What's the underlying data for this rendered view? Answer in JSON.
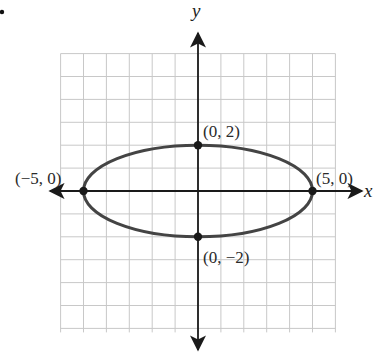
{
  "chart_data": {
    "type": "line",
    "title": "",
    "subtitle": "",
    "xlabel": "x",
    "ylabel": "y",
    "xlim": [
      -6,
      6
    ],
    "ylim": [
      -6,
      6
    ],
    "grid": true,
    "legend": null,
    "curve": {
      "kind": "ellipse",
      "equation": "x^2/25 + y^2/4 = 1",
      "center": [
        0,
        0
      ],
      "semi_major_x": 5,
      "semi_minor_y": 2
    },
    "points": [
      {
        "x": -5,
        "y": 0,
        "label": "(−5, 0)"
      },
      {
        "x": 5,
        "y": 0,
        "label": "(5, 0)"
      },
      {
        "x": 0,
        "y": 2,
        "label": "(0, 2)"
      },
      {
        "x": 0,
        "y": -2,
        "label": "(0, −2)"
      }
    ],
    "annotations": [
      "(−5, 0)",
      "(5, 0)",
      "(0, 2)",
      "(0, −2)"
    ]
  },
  "labels": {
    "x_axis": "x",
    "y_axis": "y",
    "left_vertex": "(−5, 0)",
    "right_vertex": "(5, 0)",
    "top_covertex": "(0, 2)",
    "bottom_covertex": "(0, −2)"
  },
  "colors": {
    "grid": "#c8c8c8",
    "axis": "#1a1a1a",
    "curve": "#444444",
    "point": "#1a1a1a",
    "text": "#2a2a2a"
  },
  "layout": {
    "origin_px": [
      198,
      191
    ],
    "unit_px": 22.9,
    "grid_range": [
      -6,
      6
    ]
  }
}
